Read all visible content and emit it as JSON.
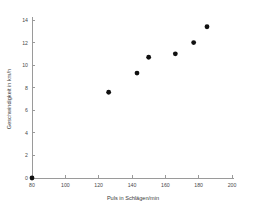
{
  "chart_data": {
    "type": "scatter",
    "title": "",
    "xlabel": "Puls in Schlägen/min",
    "ylabel": "Geschwindigkeit in km/h",
    "xlim": [
      80,
      200
    ],
    "ylim": [
      0,
      14
    ],
    "xticks": [
      80,
      100,
      120,
      140,
      160,
      180,
      200
    ],
    "yticks": [
      0,
      2,
      4,
      6,
      8,
      10,
      12,
      14
    ],
    "xtick_labels": [
      "80",
      "100",
      "120",
      "140",
      "160",
      "180",
      "200"
    ],
    "ytick_labels": [
      "0",
      "2",
      "4",
      "6",
      "8",
      "10",
      "12",
      "14"
    ],
    "grid": false,
    "legend": null,
    "marker": "filled-circle",
    "marker_color": "#101010",
    "axis_color": "#9a9a9a",
    "points": [
      {
        "x": 80,
        "y": 0
      },
      {
        "x": 126,
        "y": 7.6
      },
      {
        "x": 143,
        "y": 9.3
      },
      {
        "x": 150,
        "y": 10.7
      },
      {
        "x": 166,
        "y": 11.0
      },
      {
        "x": 177,
        "y": 12.0
      },
      {
        "x": 185,
        "y": 13.4
      }
    ],
    "series": [
      {
        "name": "Messwerte",
        "x": [
          80,
          126,
          143,
          150,
          166,
          177,
          185
        ],
        "values": [
          0,
          7.6,
          9.3,
          10.7,
          11.0,
          12.0,
          13.4
        ]
      }
    ]
  },
  "axis_titles": {
    "x": "Puls in Schlägen/min",
    "y": "Geschwindigkeit in km/h"
  }
}
